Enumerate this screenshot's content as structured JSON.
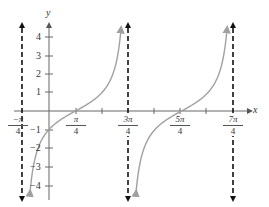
{
  "chart_data": {
    "type": "line",
    "title": "",
    "function": "y = tan(x - π/4)",
    "xlabel": "x",
    "ylabel": "y",
    "x_ticks": [
      {
        "label_num": "−π",
        "label_den": "4",
        "value": -0.785
      },
      {
        "label_num": "π",
        "label_den": "4",
        "value": 0.785
      },
      {
        "label_num": "3π",
        "label_den": "4",
        "value": 2.356
      },
      {
        "label_num": "5π",
        "label_den": "4",
        "value": 3.927
      },
      {
        "label_num": "7π",
        "label_den": "4",
        "value": 5.498
      }
    ],
    "x_minor_ticks": [
      1.571,
      3.142,
      4.712
    ],
    "y_ticks": [
      4,
      3,
      2,
      1,
      -1,
      -2,
      -3,
      -4
    ],
    "ylim": [
      -4.5,
      4.5
    ],
    "xlim": [
      -0.785,
      5.9
    ],
    "asymptotes": [
      -0.785,
      2.356,
      5.498
    ],
    "zeros": [
      0.785,
      3.927
    ],
    "series": [
      {
        "name": "branch-1",
        "x_range": [
          -0.785,
          2.356
        ],
        "points": [
          [
            -0.57,
            -4.5
          ],
          [
            0,
            -1
          ],
          [
            0.785,
            0
          ],
          [
            1.571,
            1
          ],
          [
            2.14,
            4.5
          ]
        ]
      },
      {
        "name": "branch-2",
        "x_range": [
          2.356,
          5.498
        ],
        "points": [
          [
            2.57,
            -4.5
          ],
          [
            3.142,
            -1
          ],
          [
            3.927,
            0
          ],
          [
            4.712,
            1
          ],
          [
            5.28,
            4.5
          ]
        ]
      }
    ],
    "grid": false,
    "legend": null,
    "colors": {
      "curve": "#a0a0a0",
      "axes": "#555555",
      "asymptote": "#111111"
    }
  },
  "labels": {
    "x_axis": "x",
    "y_axis": "y",
    "y_ticks": [
      "4",
      "3",
      "2",
      "1",
      "−1",
      "−2",
      "−3",
      "−4"
    ],
    "x_ticks": [
      {
        "num": "π",
        "den": "4",
        "neg": "−"
      },
      {
        "num": "π",
        "den": "4",
        "neg": ""
      },
      {
        "num": "3π",
        "den": "4",
        "neg": ""
      },
      {
        "num": "5π",
        "den": "4",
        "neg": ""
      },
      {
        "num": "7π",
        "den": "4",
        "neg": ""
      }
    ]
  }
}
